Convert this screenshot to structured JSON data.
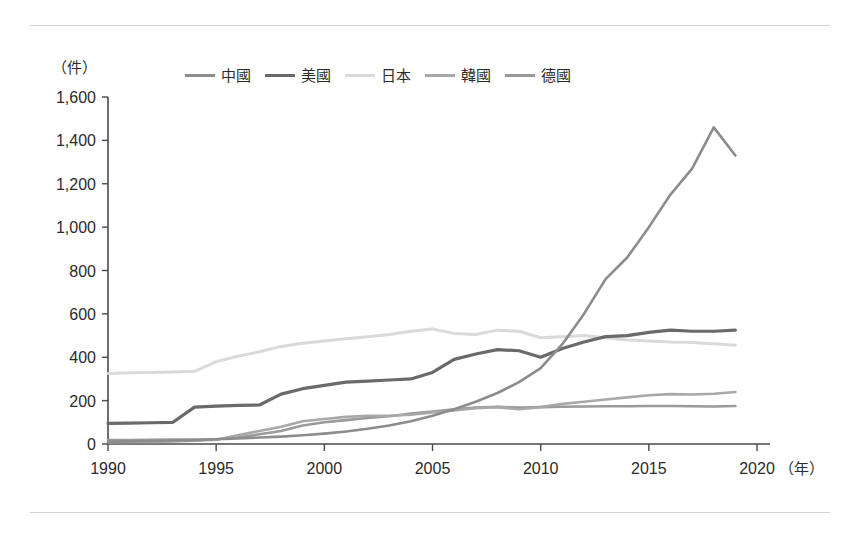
{
  "chart_data": {
    "type": "line",
    "title": "",
    "subtitle": "",
    "xlabel": "（年）",
    "ylabel": "（件）",
    "xlim": [
      1990,
      2020
    ],
    "ylim": [
      0,
      1600
    ],
    "ytick_step": 200,
    "xtick_step": 5,
    "grid": false,
    "legend_position": "top",
    "yticks": [
      "0",
      "200",
      "400",
      "600",
      "800",
      "1,000",
      "1,200",
      "1,400",
      "1,600"
    ],
    "xticks": [
      "1990",
      "1995",
      "2000",
      "2005",
      "2010",
      "2015",
      "2020"
    ],
    "x": [
      1990,
      1991,
      1992,
      1993,
      1994,
      1995,
      1996,
      1997,
      1998,
      1999,
      2000,
      2001,
      2002,
      2003,
      2004,
      2005,
      2006,
      2007,
      2008,
      2009,
      2010,
      2011,
      2012,
      2013,
      2014,
      2015,
      2016,
      2017,
      2018,
      2019
    ],
    "series": [
      {
        "name": "中國",
        "color": "#8c8c8c",
        "width": 2.6,
        "values": [
          10,
          12,
          14,
          16,
          18,
          22,
          26,
          30,
          34,
          40,
          48,
          58,
          70,
          85,
          105,
          130,
          160,
          195,
          235,
          285,
          350,
          460,
          600,
          760,
          860,
          1000,
          1150,
          1270,
          1460,
          1330
        ]
      },
      {
        "name": "美國",
        "color": "#6a6a6a",
        "width": 3.2,
        "values": [
          95,
          96,
          98,
          100,
          170,
          175,
          178,
          180,
          230,
          255,
          270,
          285,
          290,
          295,
          300,
          330,
          390,
          415,
          435,
          430,
          400,
          440,
          470,
          495,
          500,
          515,
          525,
          520,
          520,
          525
        ]
      },
      {
        "name": "日本",
        "color": "#dadada",
        "width": 3.0,
        "values": [
          325,
          328,
          330,
          332,
          335,
          380,
          405,
          425,
          450,
          465,
          475,
          485,
          495,
          505,
          520,
          530,
          510,
          505,
          525,
          520,
          490,
          495,
          500,
          490,
          480,
          475,
          470,
          468,
          462,
          455
        ]
      },
      {
        "name": "韓國",
        "color": "#a8a8a8",
        "width": 2.6,
        "values": [
          8,
          9,
          10,
          12,
          15,
          20,
          40,
          60,
          80,
          105,
          115,
          125,
          130,
          130,
          135,
          145,
          155,
          165,
          170,
          160,
          170,
          185,
          195,
          205,
          215,
          225,
          230,
          228,
          232,
          240
        ]
      },
      {
        "name": "德國",
        "color": "#9a9a9a",
        "width": 2.6,
        "values": [
          18,
          18,
          19,
          20,
          20,
          22,
          30,
          45,
          60,
          85,
          100,
          110,
          120,
          128,
          140,
          150,
          160,
          168,
          172,
          168,
          170,
          172,
          173,
          174,
          174,
          175,
          175,
          174,
          173,
          175
        ]
      }
    ]
  },
  "axis": {
    "y_unit": "（件）",
    "x_unit": "（年）"
  },
  "legend": {
    "items": [
      {
        "label": "中國",
        "color": "#8c8c8c"
      },
      {
        "label": "美國",
        "color": "#6a6a6a"
      },
      {
        "label": "日本",
        "color": "#dadada"
      },
      {
        "label": "韓國",
        "color": "#a8a8a8"
      },
      {
        "label": "德國",
        "color": "#9a9a9a"
      }
    ]
  }
}
